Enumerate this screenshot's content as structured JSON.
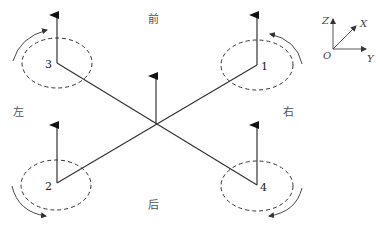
{
  "diagram": {
    "type": "quadrotor-frame",
    "directions": {
      "front": "前",
      "back": "后",
      "left": "左",
      "right": "右"
    },
    "motors": [
      {
        "id": "1",
        "label": "1",
        "rotation": "counterclockwise"
      },
      {
        "id": "2",
        "label": "2",
        "rotation": "clockwise"
      },
      {
        "id": "3",
        "label": "3",
        "rotation": "clockwise"
      },
      {
        "id": "4",
        "label": "4",
        "rotation": "counterclockwise"
      }
    ],
    "coordinate_system": {
      "origin": "O",
      "x": "X",
      "y": "Y",
      "z": "Z"
    },
    "colors": {
      "line": "#333333",
      "text": "#444444",
      "background": "#ffffff"
    }
  }
}
